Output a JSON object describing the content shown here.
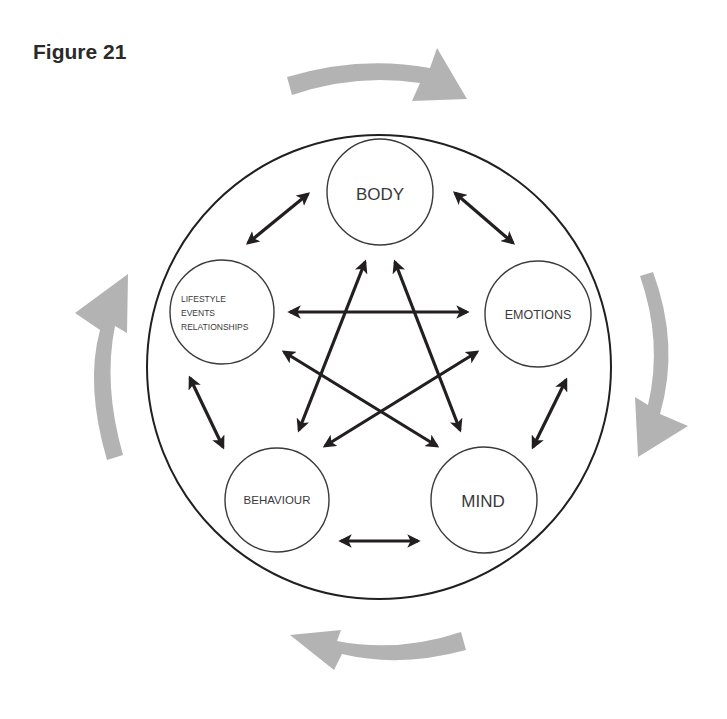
{
  "figure": {
    "title": "Figure 21"
  },
  "nodes": {
    "body": {
      "label": "BODY"
    },
    "emotions": {
      "label": "EMOTIONS"
    },
    "mind": {
      "label": "MIND"
    },
    "behaviour": {
      "label": "BEHAVIOUR"
    },
    "lifestyle": {
      "lines": [
        "LIFESTYLE",
        "EVENTS",
        "RELATIONSHIPS"
      ]
    }
  },
  "connections": {
    "adjacent": [
      [
        "body",
        "emotions"
      ],
      [
        "emotions",
        "mind"
      ],
      [
        "mind",
        "behaviour"
      ],
      [
        "behaviour",
        "lifestyle"
      ],
      [
        "lifestyle",
        "body"
      ]
    ],
    "star": [
      [
        "body",
        "behaviour"
      ],
      [
        "body",
        "mind"
      ],
      [
        "lifestyle",
        "emotions"
      ],
      [
        "lifestyle",
        "mind"
      ],
      [
        "emotions",
        "behaviour"
      ]
    ],
    "arrow_type": "bidirectional"
  },
  "cycle_arrows": {
    "direction": "clockwise",
    "count": 4,
    "color": "#b3b3b3"
  },
  "colors": {
    "ink": "#231f20",
    "circle_stroke": "#3a3a3a",
    "cycle_arrow": "#b3b3b3"
  }
}
